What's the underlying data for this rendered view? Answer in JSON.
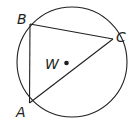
{
  "diagram": {
    "type": "inscribed-triangle-in-circle",
    "center_label": "W",
    "vertices": [
      "A",
      "B",
      "C"
    ],
    "segments": [
      "AB",
      "BC",
      "CA"
    ],
    "colors": {
      "stroke": "#231f20",
      "background": "#ffffff"
    }
  }
}
